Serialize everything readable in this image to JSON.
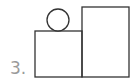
{
  "figure": {
    "number_label": "3.",
    "shapes": {
      "left_rect": {
        "x": 35,
        "y": 31,
        "w": 47,
        "h": 46
      },
      "right_rect": {
        "x": 82,
        "y": 7,
        "w": 47,
        "h": 70
      },
      "circle": {
        "cx": 58,
        "cy": 20,
        "r": 11
      }
    },
    "stroke_color": "#333333",
    "label_color": "#9a9a9a"
  }
}
